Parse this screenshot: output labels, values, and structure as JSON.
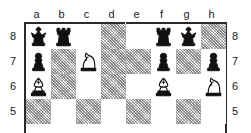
{
  "diagram": {
    "type": "chess-position-pair",
    "boards": [
      {
        "id": "left-board",
        "files": [
          "a",
          "b",
          "c",
          "d"
        ],
        "ranks": [
          "8",
          "7",
          "6",
          "5"
        ],
        "rank_label_side": "left",
        "squares": [
          [
            {
              "square": "a8",
              "shade": "light",
              "piece": "black-king",
              "glyph": "k"
            },
            {
              "square": "b8",
              "shade": "light",
              "piece": "black-rook",
              "glyph": "r"
            },
            {
              "square": "c8",
              "shade": "light",
              "piece": null,
              "glyph": ""
            },
            {
              "square": "d8",
              "shade": "dark",
              "piece": null,
              "glyph": ""
            }
          ],
          [
            {
              "square": "a7",
              "shade": "light",
              "piece": "black-pawn",
              "glyph": "p"
            },
            {
              "square": "b7",
              "shade": "dark",
              "piece": null,
              "glyph": ""
            },
            {
              "square": "c7",
              "shade": "light",
              "piece": "white-knight",
              "glyph": "N"
            },
            {
              "square": "d7",
              "shade": "dark",
              "piece": null,
              "glyph": ""
            }
          ],
          [
            {
              "square": "a6",
              "shade": "light",
              "piece": "white-bishop",
              "glyph": "B"
            },
            {
              "square": "b6",
              "shade": "dark",
              "piece": null,
              "glyph": ""
            },
            {
              "square": "c6",
              "shade": "light",
              "piece": null,
              "glyph": ""
            },
            {
              "square": "d6",
              "shade": "dark",
              "piece": null,
              "glyph": ""
            }
          ],
          [
            {
              "square": "a5",
              "shade": "dark",
              "piece": null,
              "glyph": ""
            },
            {
              "square": "b5",
              "shade": "light",
              "piece": null,
              "glyph": ""
            },
            {
              "square": "c5",
              "shade": "dark",
              "piece": null,
              "glyph": ""
            },
            {
              "square": "d5",
              "shade": "light",
              "piece": null,
              "glyph": ""
            }
          ]
        ]
      },
      {
        "id": "right-board",
        "files": [
          "e",
          "f",
          "g",
          "h"
        ],
        "ranks": [
          "8",
          "7",
          "6",
          "5"
        ],
        "rank_label_side": "right",
        "squares": [
          [
            {
              "square": "e8",
              "shade": "light",
              "piece": null,
              "glyph": ""
            },
            {
              "square": "f8",
              "shade": "light",
              "piece": "black-rook",
              "glyph": "r"
            },
            {
              "square": "g8",
              "shade": "light",
              "piece": "black-king",
              "glyph": "k"
            },
            {
              "square": "h8",
              "shade": "dark",
              "piece": null,
              "glyph": ""
            }
          ],
          [
            {
              "square": "e7",
              "shade": "dark",
              "piece": null,
              "glyph": ""
            },
            {
              "square": "f7",
              "shade": "light",
              "piece": "black-pawn",
              "glyph": "p"
            },
            {
              "square": "g7",
              "shade": "dark",
              "piece": null,
              "glyph": ""
            },
            {
              "square": "h7",
              "shade": "light",
              "piece": "black-pawn",
              "glyph": "p"
            }
          ],
          [
            {
              "square": "e6",
              "shade": "light",
              "piece": null,
              "glyph": ""
            },
            {
              "square": "f6",
              "shade": "light",
              "piece": "white-bishop",
              "glyph": "B"
            },
            {
              "square": "g6",
              "shade": "light",
              "piece": null,
              "glyph": ""
            },
            {
              "square": "h6",
              "shade": "light",
              "piece": "white-knight",
              "glyph": "N"
            }
          ],
          [
            {
              "square": "e5",
              "shade": "dark",
              "piece": null,
              "glyph": ""
            },
            {
              "square": "f5",
              "shade": "light",
              "piece": null,
              "glyph": ""
            },
            {
              "square": "g5",
              "shade": "dark",
              "piece": null,
              "glyph": ""
            },
            {
              "square": "h5",
              "shade": "light",
              "piece": null,
              "glyph": ""
            }
          ]
        ]
      }
    ],
    "colors": {
      "ink": "#1a1a1a",
      "border": "#2b2b2b",
      "light_square": "#ffffff",
      "dark_square_hatch": "#6b6b6b",
      "page": "#ffffff"
    }
  }
}
